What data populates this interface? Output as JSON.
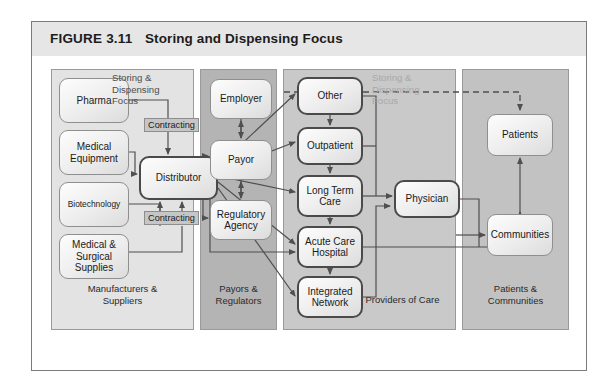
{
  "figure": {
    "number": "FIGURE 3.11",
    "title": "Storing and Dispensing Focus"
  },
  "lanes": [
    {
      "id": "manufacturers",
      "label": "Manufacturers &\nSuppliers",
      "color": "#e3e3e3"
    },
    {
      "id": "payors",
      "label": "Payors &\nRegulators",
      "color": "#b4b4b4"
    },
    {
      "id": "providers",
      "label": "Providers of Care",
      "color": "#c9c9c9"
    },
    {
      "id": "patients",
      "label": "Patients &\nCommunities",
      "color": "#c2c2c2"
    }
  ],
  "nodes": {
    "pharma": "Pharma",
    "medical_equipment": "Medical\nEquipment",
    "biotechnology": "Biotechnology",
    "medical_surgical": "Medical &\nSurgical\nSupplies",
    "distributor": "Distributor",
    "employer": "Employer",
    "payor": "Payor",
    "regulatory_agency": "Regulatory\nAgency",
    "other": "Other",
    "outpatient": "Outpatient",
    "long_term_care": "Long Term\nCare",
    "acute_care_hospital": "Acute Care\nHospital",
    "integrated_network": "Integrated\nNetwork",
    "physician": "Physician",
    "patients": "Patients",
    "communities": "Communities"
  },
  "annotations": {
    "focus_left": "Storing &\nDispensing\nFocus",
    "focus_right": "Storing &\nDispensing\nFocus",
    "contracting_1": "Contracting",
    "contracting_2": "Contracting"
  },
  "colors": {
    "frame_border": "#7b7b7b",
    "title_bar": "#e6e6e6",
    "lane_manufacturers": "#e3e3e3",
    "lane_payors": "#b4b4b4",
    "lane_providers": "#c9c9c9",
    "lane_patients": "#c2c2c2",
    "node_border": "#8f8f8f",
    "node_border_thick": "#4a4a4a",
    "connector": "#4f4f4f",
    "chip_fill": "#c6c6c6",
    "annotation_left": "#4d4d4d",
    "annotation_right": "#a8a8a8"
  }
}
